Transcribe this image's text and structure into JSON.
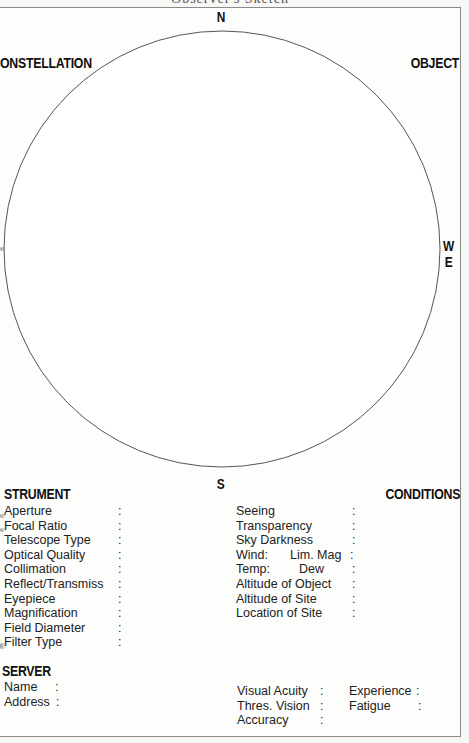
{
  "page": {
    "top_header_clipped": "Observer's Sketch",
    "colors": {
      "background": "#f7f7f6",
      "sheet": "#fdfdfc",
      "ink": "#111111",
      "circle_stroke": "#555555",
      "border": "#8a8a8a"
    }
  },
  "field_of_view": {
    "shape": "circle",
    "compass": {
      "north": "N",
      "south": "S",
      "west": "W",
      "east": "E"
    }
  },
  "corners": {
    "top_left": "ONSTELLATION",
    "top_right": "OBJECT"
  },
  "instrument": {
    "heading": "STRUMENT",
    "fields": [
      {
        "label": "Aperture",
        "colon": ":"
      },
      {
        "label": "Focal Ratio",
        "colon": ":"
      },
      {
        "label": "Telescope Type",
        "colon": ":"
      },
      {
        "label": "Optical Quality",
        "colon": ":"
      },
      {
        "label": "Collimation",
        "colon": ":"
      },
      {
        "label": "Reflect/Transmiss",
        "colon": ":"
      },
      {
        "label": "Eyepiece",
        "colon": ":"
      },
      {
        "label": "Magnification",
        "colon": ":"
      },
      {
        "label": "Field Diameter",
        "colon": ":"
      },
      {
        "label": "Filter Type",
        "colon": ":"
      }
    ]
  },
  "conditions": {
    "heading": "CONDITIONS",
    "fields": [
      {
        "label": "Seeing",
        "colon": ":"
      },
      {
        "label": "Transparency",
        "colon": ":"
      },
      {
        "label": "Sky Darkness",
        "colon": ":"
      },
      {
        "label": "Wind:",
        "label2": "Lim. Mag",
        "colon": ":"
      },
      {
        "label": "Temp:",
        "label2": "Dew",
        "colon": ":"
      },
      {
        "label": "Altitude of Object",
        "colon": ":"
      },
      {
        "label": "Altitude of Site",
        "colon": ":"
      },
      {
        "label": "Location of Site",
        "colon": ":"
      }
    ]
  },
  "observer": {
    "heading": "SERVER",
    "fields": [
      {
        "label": "Name",
        "colon": ":"
      },
      {
        "label": "Address",
        "colon": ":"
      }
    ],
    "vision": [
      {
        "label": "Visual Acuity",
        "colon": ":"
      },
      {
        "label": "Thres. Vision",
        "colon": ":"
      },
      {
        "label": "Accuracy",
        "colon": ":"
      }
    ],
    "state": [
      {
        "label": "Experience",
        "colon": ":"
      },
      {
        "label": "Fatigue",
        "colon": ":"
      }
    ]
  }
}
